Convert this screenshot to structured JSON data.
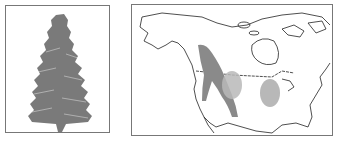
{
  "figure": {
    "left_panel": {
      "subject": "conifer-tree-illustration",
      "color": "#7a7a7a"
    },
    "right_panel": {
      "subject": "north-america-range-map",
      "outline_color": "#222222",
      "range_dark_color": "#8a8a8a",
      "range_light_color": "#b8b8b8"
    }
  }
}
